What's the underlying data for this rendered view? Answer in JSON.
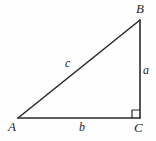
{
  "figure": {
    "type": "right-triangle-diagram",
    "background_color": "#fefefe",
    "stroke_color": "#2b2b2b",
    "label_color": "#2a2a2a",
    "vertices": {
      "A": {
        "label": "A",
        "x": 18,
        "y": 118
      },
      "B": {
        "label": "B",
        "x": 140,
        "y": 20
      },
      "C": {
        "label": "C",
        "x": 140,
        "y": 118
      }
    },
    "sides": {
      "a": {
        "label": "a",
        "from": "B",
        "to": "C",
        "description": "vertical leg"
      },
      "b": {
        "label": "b",
        "from": "A",
        "to": "C",
        "description": "horizontal leg"
      },
      "c": {
        "label": "c",
        "from": "A",
        "to": "B",
        "description": "hypotenuse"
      }
    },
    "right_angle": {
      "at_vertex": "C",
      "marker": "square",
      "size": 8
    }
  }
}
